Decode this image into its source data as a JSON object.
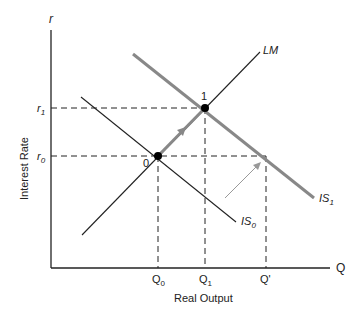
{
  "diagram": {
    "axes": {
      "y_symbol": "r",
      "y_label": "Interest Rate",
      "x_symbol": "Q",
      "x_label": "Real Output"
    },
    "y_ticks": [
      {
        "label": "r",
        "sub": "1",
        "y": 108
      },
      {
        "label": "r",
        "sub": "0",
        "y": 156
      }
    ],
    "x_ticks": [
      {
        "label": "Q",
        "sub": "0",
        "x": 158
      },
      {
        "label": "Q",
        "sub": "1",
        "x": 205
      },
      {
        "label": "Q'",
        "sub": "",
        "x": 266
      }
    ],
    "curves": {
      "LM": {
        "label": "LM"
      },
      "IS0": {
        "label": "IS",
        "sub": "0"
      },
      "IS1": {
        "label": "IS",
        "sub": "1"
      }
    },
    "points": [
      {
        "label": "0"
      },
      {
        "label": "1"
      }
    ],
    "colors": {
      "axis": "#222222",
      "is1": "#888888",
      "arrow": "#888888",
      "thin_arrow": "#999999"
    }
  }
}
